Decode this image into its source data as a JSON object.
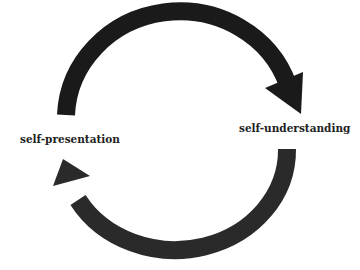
{
  "diagram": {
    "type": "cycle",
    "nodes": [
      {
        "id": "self-presentation",
        "label": "self-presentation"
      },
      {
        "id": "self-understanding",
        "label": "self-understanding"
      }
    ],
    "edges": [
      {
        "from": "self-presentation",
        "to": "self-understanding",
        "direction": "clockwise-top"
      },
      {
        "from": "self-understanding",
        "to": "self-presentation",
        "direction": "clockwise-bottom"
      }
    ],
    "colors": {
      "top_arrow": "#1a1a1a",
      "bottom_arrow": "#2a2a2a",
      "text": "#222222",
      "background": "#ffffff"
    }
  }
}
